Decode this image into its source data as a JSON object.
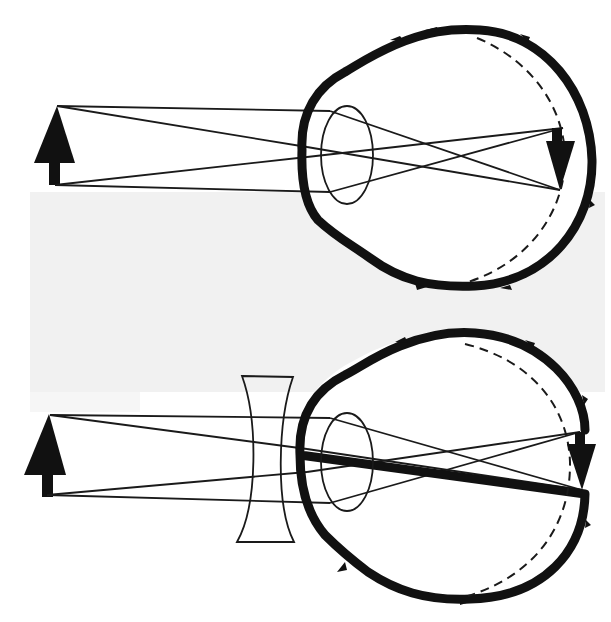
{
  "figure": {
    "title": "Myopia and its correction with a concave (diverging) lens",
    "panels": [
      {
        "id": "myopic-eye",
        "description": "Uncorrected myopic eye: rays from a distant upright object focus in front of the retina, forming an inverted image before the retina.",
        "object": "upright arrow",
        "image": "inverted arrow",
        "elements": [
          "object-arrow",
          "light-rays",
          "eye-outline",
          "crystalline-lens",
          "normal-retina-dashed",
          "inverted-image-arrow"
        ]
      },
      {
        "id": "corrected-eye",
        "description": "Myopic eye corrected with a concave lens placed in front of the eye so the image is focused on the retina.",
        "object": "upright arrow",
        "corrective_lens": "concave (diverging) lens",
        "image": "inverted arrow",
        "elements": [
          "object-arrow",
          "concave-lens",
          "light-rays",
          "eye-outline",
          "crystalline-lens",
          "normal-retina-dashed",
          "inverted-image-arrow"
        ]
      }
    ],
    "colors": {
      "ink": "#111111",
      "background": "#ffffff",
      "paper_shade": "#f1f1f1"
    }
  }
}
